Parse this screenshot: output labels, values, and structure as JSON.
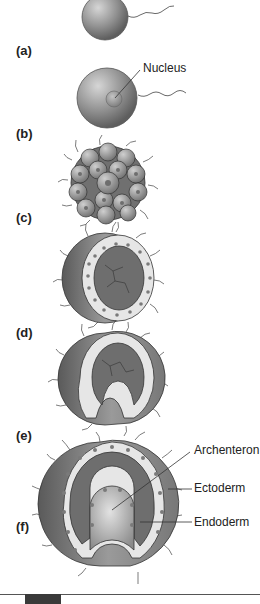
{
  "figure": {
    "stages": [
      {
        "id": "a",
        "label": "(a)",
        "name": "unfertilized-egg"
      },
      {
        "id": "b",
        "label": "(b)",
        "name": "fertilized-egg"
      },
      {
        "id": "c",
        "label": "(c)",
        "name": "morula"
      },
      {
        "id": "d",
        "label": "(d)",
        "name": "blastula"
      },
      {
        "id": "e",
        "label": "(e)",
        "name": "early-gastrula"
      },
      {
        "id": "f",
        "label": "(f)",
        "name": "late-gastrula"
      }
    ],
    "callouts": {
      "nucleus": "Nucleus",
      "archenteron": "Archenteron",
      "ectoderm": "Ectoderm",
      "endoderm": "Endoderm"
    },
    "colors": {
      "sphere_dark": "#6a6a6a",
      "sphere_light": "#c8c8c8",
      "cavity": "#6e6e6e",
      "cell_fill": "#e6e6e6",
      "cell_nucleus": "#7a7a7a",
      "outline": "#333333"
    }
  }
}
